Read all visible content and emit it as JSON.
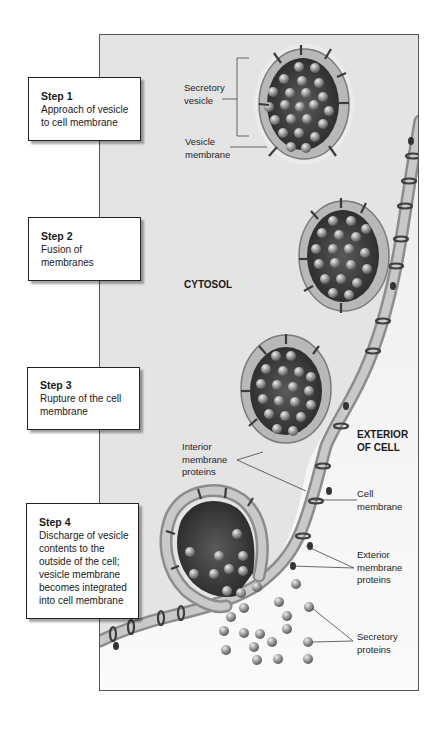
{
  "steps": [
    {
      "title": "Step 1",
      "description": "Approach of vesicle\nto cell membrane"
    },
    {
      "title": "Step 2",
      "description": "Fusion of\nmembranes"
    },
    {
      "title": "Step 3",
      "description": "Rupture of the cell\nmembrane"
    },
    {
      "title": "Step 4",
      "description": "Discharge of vesicle\ncontents to the\noutside of the cell;\nvesicle membrane\nbecomes integrated\ninto cell membrane"
    }
  ],
  "regions": {
    "cytosol": "CYTOSOL",
    "exterior": "EXTERIOR\nOF CELL"
  },
  "labels": {
    "secretory_vesicle": "Secretory\nvesicle",
    "vesicle_membrane": "Vesicle\nmembrane",
    "interior_membrane_proteins": "Interior\nmembrane\nproteins",
    "cell_membrane": "Cell\nmembrane",
    "exterior_membrane_proteins": "Exterior\nmembrane\nproteins",
    "secretory_proteins": "Secretory\nproteins"
  },
  "colors": {
    "background": "#ffffff",
    "cytosol": "#e6e6e6",
    "exterior": "#f4f4f4",
    "membrane": "#b8b8b8",
    "vesicle_interior": "#3a3a3a",
    "protein_sphere": "#9a9a9a",
    "frame_border": "#555555"
  }
}
